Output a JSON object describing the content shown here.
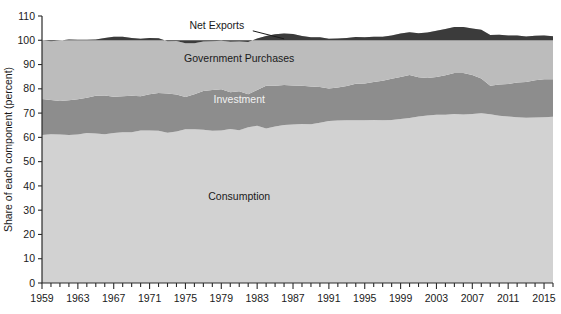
{
  "chart_data": {
    "type": "area",
    "stacked": true,
    "title": "",
    "xlabel": "",
    "ylabel": "Share of each component (percent)",
    "ylim": [
      0,
      110
    ],
    "xlim": [
      1959,
      2016
    ],
    "ytick_values": [
      0,
      10,
      20,
      30,
      40,
      50,
      60,
      70,
      80,
      90,
      100,
      110
    ],
    "ytick_labels": [
      "0",
      "10",
      "20",
      "30",
      "40",
      "50",
      "60",
      "70",
      "80",
      "90",
      "100",
      "110"
    ],
    "xtick_labels": [
      "1959",
      "1963",
      "1967",
      "1971",
      "1975",
      "1979",
      "1983",
      "1987",
      "1991",
      "1995",
      "1999",
      "2003",
      "2007",
      "2011",
      "2015"
    ],
    "xtick_values": [
      1959,
      1963,
      1967,
      1971,
      1975,
      1979,
      1983,
      1987,
      1991,
      1995,
      1999,
      2003,
      2007,
      2011,
      2015
    ],
    "minor_xtick_step": 1,
    "grid": false,
    "legend_position": "inline-annotations",
    "colors": {
      "consumption": "#d2d2d2",
      "investment": "#8d8d8d",
      "government": "#bcbcbc",
      "net_exports": "#3b3b3b",
      "background": "#ffffff",
      "axis": "#2b2b2b",
      "text_dark": "#1a1a1a",
      "text_light": "#f2f2f2"
    },
    "annotations": [
      {
        "name": "net-exports",
        "text": "Net Exports",
        "x": 1978.5,
        "y": 104.5,
        "style": "dark",
        "leader_to_x": 1986.0,
        "leader_to_y": 100.6
      },
      {
        "name": "government-purchases",
        "text": "Government Purchases",
        "x": 1981.0,
        "y": 91.0,
        "style": "dark"
      },
      {
        "name": "investment",
        "text": "Investment",
        "x": 1981.0,
        "y": 74.0,
        "style": "light"
      },
      {
        "name": "consumption",
        "text": "Consumption",
        "x": 1981.0,
        "y": 34.0,
        "style": "dark"
      }
    ],
    "x": [
      1959,
      1960,
      1961,
      1962,
      1963,
      1964,
      1965,
      1966,
      1967,
      1968,
      1969,
      1970,
      1971,
      1972,
      1973,
      1974,
      1975,
      1976,
      1977,
      1978,
      1979,
      1980,
      1981,
      1982,
      1983,
      1984,
      1985,
      1986,
      1987,
      1988,
      1989,
      1990,
      1991,
      1992,
      1993,
      1994,
      1995,
      1996,
      1997,
      1998,
      1999,
      2000,
      2001,
      2002,
      2003,
      2004,
      2005,
      2006,
      2007,
      2008,
      2009,
      2010,
      2011,
      2012,
      2013,
      2014,
      2015,
      2016
    ],
    "series": [
      {
        "name": "Consumption",
        "key": "consumption",
        "values": [
          61.0,
          61.3,
          61.2,
          61.0,
          61.2,
          61.8,
          61.6,
          61.3,
          61.8,
          62.1,
          62.1,
          62.8,
          62.8,
          62.7,
          61.9,
          62.4,
          63.3,
          63.3,
          63.1,
          62.7,
          62.8,
          63.4,
          62.9,
          64.2,
          64.8,
          63.7,
          64.5,
          65.1,
          65.3,
          65.5,
          65.4,
          66.0,
          66.7,
          66.9,
          67.0,
          67.0,
          67.1,
          67.2,
          67.0,
          67.2,
          67.6,
          68.0,
          68.6,
          69.0,
          69.3,
          69.3,
          69.6,
          69.4,
          69.6,
          69.9,
          69.5,
          68.9,
          68.6,
          68.3,
          68.1,
          68.2,
          68.3,
          68.5
        ]
      },
      {
        "name": "Investment",
        "key": "investment",
        "values": [
          14.8,
          14.1,
          13.8,
          14.3,
          14.5,
          14.5,
          15.5,
          15.9,
          14.9,
          14.8,
          15.0,
          14.1,
          15.0,
          15.6,
          16.2,
          15.3,
          13.3,
          14.5,
          16.0,
          16.8,
          17.0,
          15.2,
          16.1,
          13.6,
          14.7,
          17.6,
          16.8,
          16.5,
          16.1,
          15.8,
          15.6,
          14.7,
          13.4,
          13.6,
          14.2,
          15.1,
          15.1,
          15.6,
          16.3,
          16.9,
          17.3,
          17.7,
          16.2,
          15.5,
          15.6,
          16.3,
          16.9,
          17.1,
          16.1,
          14.4,
          11.8,
          12.9,
          13.4,
          14.3,
          14.7,
          15.3,
          15.6,
          15.4
        ]
      },
      {
        "name": "Government Purchases",
        "key": "government",
        "values": [
          24.2,
          24.2,
          24.9,
          25.0,
          24.5,
          23.9,
          23.2,
          23.7,
          24.7,
          24.5,
          23.8,
          23.7,
          23.1,
          22.5,
          21.5,
          22.0,
          22.2,
          21.0,
          20.4,
          20.1,
          20.0,
          20.8,
          20.5,
          21.5,
          21.2,
          20.5,
          21.2,
          21.2,
          21.2,
          20.5,
          20.2,
          20.5,
          20.5,
          20.2,
          19.7,
          19.2,
          19.0,
          18.6,
          18.2,
          17.9,
          17.9,
          17.6,
          18.1,
          18.7,
          19.0,
          19.0,
          19.0,
          19.0,
          19.2,
          20.0,
          20.9,
          20.5,
          20.0,
          19.4,
          18.8,
          18.4,
          18.1,
          17.8
        ]
      },
      {
        "name": "Net Exports",
        "key": "net_exports",
        "values": [
          0.0,
          0.4,
          0.4,
          0.2,
          0.3,
          0.6,
          0.3,
          -0.1,
          -0.2,
          -0.4,
          -0.4,
          -0.2,
          -0.5,
          -0.7,
          0.4,
          0.3,
          1.2,
          0.6,
          -0.7,
          -0.7,
          -0.4,
          0.2,
          0.0,
          -0.2,
          -1.3,
          -2.2,
          -2.5,
          -2.8,
          -2.6,
          -1.8,
          -1.2,
          -1.2,
          -0.6,
          -0.7,
          -1.0,
          -1.3,
          -1.2,
          -1.4,
          -1.5,
          -2.0,
          -2.8,
          -3.3,
          -2.9,
          -3.2,
          -3.9,
          -4.6,
          -5.5,
          -5.5,
          -4.9,
          -4.3,
          -2.2,
          -2.3,
          -2.0,
          -2.0,
          -1.6,
          -1.9,
          -2.0,
          -1.7
        ]
      }
    ]
  }
}
